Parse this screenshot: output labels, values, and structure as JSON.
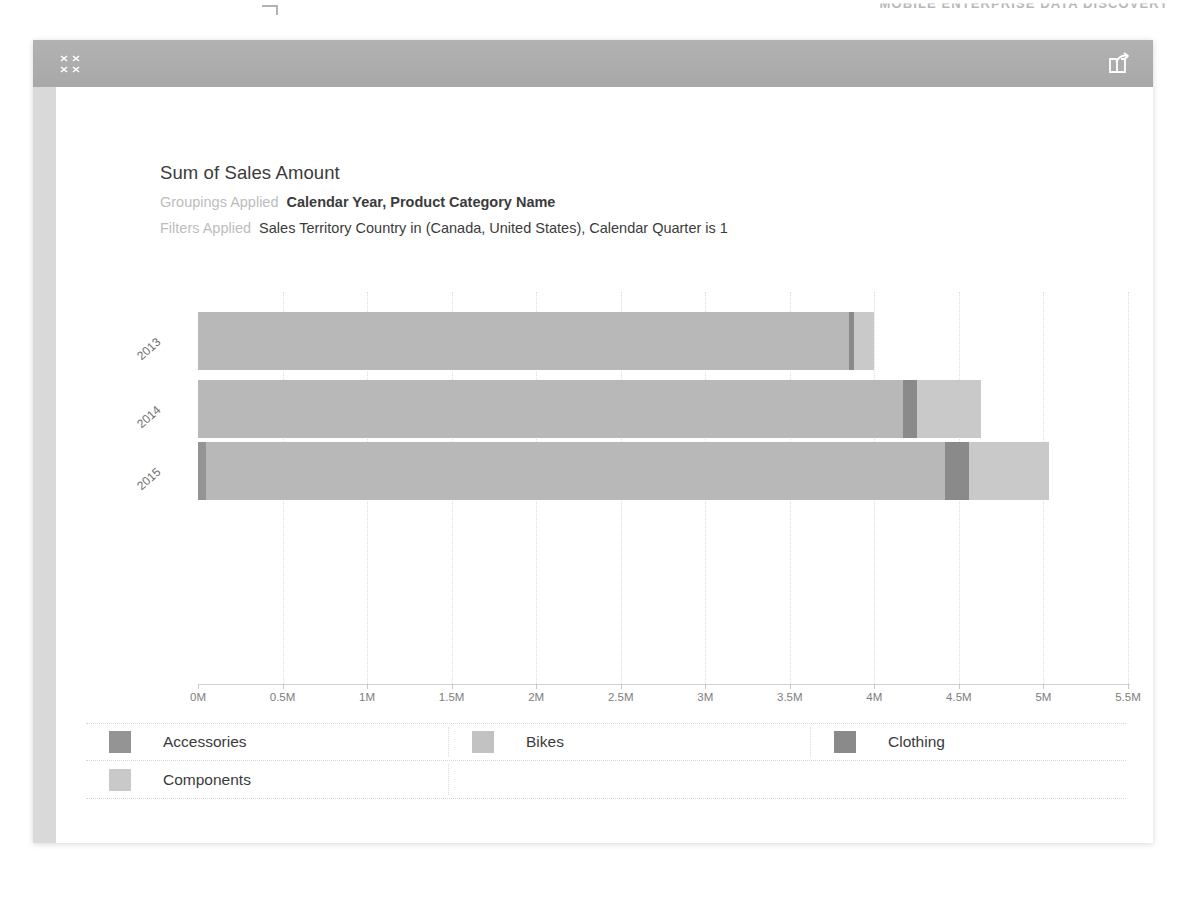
{
  "page": {
    "top_banner_text": "MOBILE ENTERPRISE DATA DISCOVERY"
  },
  "titlebar": {
    "collapse_icon": "collapse-arrows-icon",
    "share_icon": "share-export-icon"
  },
  "sidebar": {
    "handle_icon": "drag-handle-icon"
  },
  "viz": {
    "title": "Sum of Sales Amount",
    "groupings_label": "Groupings Applied",
    "groupings_value": "Calendar Year, Product Category Name",
    "filters_label": "Filters Applied",
    "filters_value": "Sales Territory Country in (Canada, United States), Calendar Quarter is 1"
  },
  "chart_data": {
    "type": "bar",
    "orientation": "horizontal",
    "stacked": true,
    "title": "Sum of Sales Amount",
    "xlabel": "",
    "ylabel": "",
    "categories": [
      "2013",
      "2014",
      "2015"
    ],
    "tick_labels": [
      "0M",
      "0.5M",
      "1M",
      "1.5M",
      "2M",
      "2.5M",
      "3M",
      "3.5M",
      "4M",
      "4.5M",
      "5M",
      "5.5M"
    ],
    "tick_values": [
      0,
      0.5,
      1,
      1.5,
      2,
      2.5,
      3,
      3.5,
      4,
      4.5,
      5,
      5.5
    ],
    "xlim": [
      0,
      5.5
    ],
    "grid": true,
    "legend_position": "bottom",
    "series": [
      {
        "name": "Accessories",
        "color": "#949494",
        "values": [
          0.0,
          0.0,
          0.05
        ]
      },
      {
        "name": "Bikes",
        "color": "#b8b8b8",
        "values": [
          3.85,
          4.17,
          4.37
        ]
      },
      {
        "name": "Clothing",
        "color": "#8a8a8a",
        "values": [
          0.03,
          0.08,
          0.14
        ]
      },
      {
        "name": "Components",
        "color": "#c9c9c9",
        "values": [
          0.12,
          0.38,
          0.47
        ]
      }
    ],
    "units": "M"
  },
  "legend": {
    "items": [
      {
        "label": "Accessories",
        "color": "#949494"
      },
      {
        "label": "Bikes",
        "color": "#c2c2c2"
      },
      {
        "label": "Clothing",
        "color": "#8a8a8a"
      },
      {
        "label": "Components",
        "color": "#c9c9c9"
      }
    ]
  }
}
